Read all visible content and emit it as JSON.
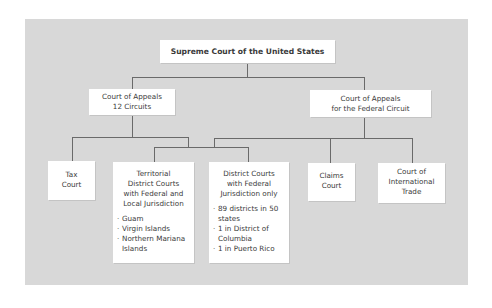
{
  "diagram": {
    "type": "org-chart",
    "title": "Supreme Court of the United States",
    "colors": {
      "panel": "#d8d8d8",
      "box": "#ffffff",
      "line": "#6a6a6a",
      "text": "#3a3a3a"
    },
    "nodes": {
      "supreme": {
        "label": "Supreme Court of the United States"
      },
      "appeals_circuits": {
        "line1": "Court of Appeals",
        "line2": "12 Circuits"
      },
      "appeals_federal": {
        "line1": "Court of Appeals",
        "line2": "for the Federal Circuit"
      },
      "tax": {
        "line1": "Tax",
        "line2": "Court"
      },
      "territorial": {
        "line1": "Territorial",
        "line2": "District Courts",
        "line3": "with Federal and",
        "line4": "Local Jurisdiction",
        "items": [
          "Guam",
          "Virgin Islands",
          "Northern Mariana Islands"
        ]
      },
      "district": {
        "line1": "District Courts",
        "line2": "with Federal",
        "line3": "Jurisdiction only",
        "items": [
          "89 districts in 50 states",
          "1 in District of Columbia",
          "1 in Puerto Rico"
        ]
      },
      "claims": {
        "line1": "Claims",
        "line2": "Court"
      },
      "international": {
        "line1": "Court of",
        "line2": "International",
        "line3": "Trade"
      }
    },
    "edges": [
      [
        "supreme",
        "appeals_circuits"
      ],
      [
        "supreme",
        "appeals_federal"
      ],
      [
        "appeals_circuits",
        "tax"
      ],
      [
        "appeals_circuits",
        "territorial"
      ],
      [
        "appeals_circuits",
        "district"
      ],
      [
        "appeals_federal",
        "district"
      ],
      [
        "appeals_federal",
        "claims"
      ],
      [
        "appeals_federal",
        "international"
      ]
    ]
  }
}
